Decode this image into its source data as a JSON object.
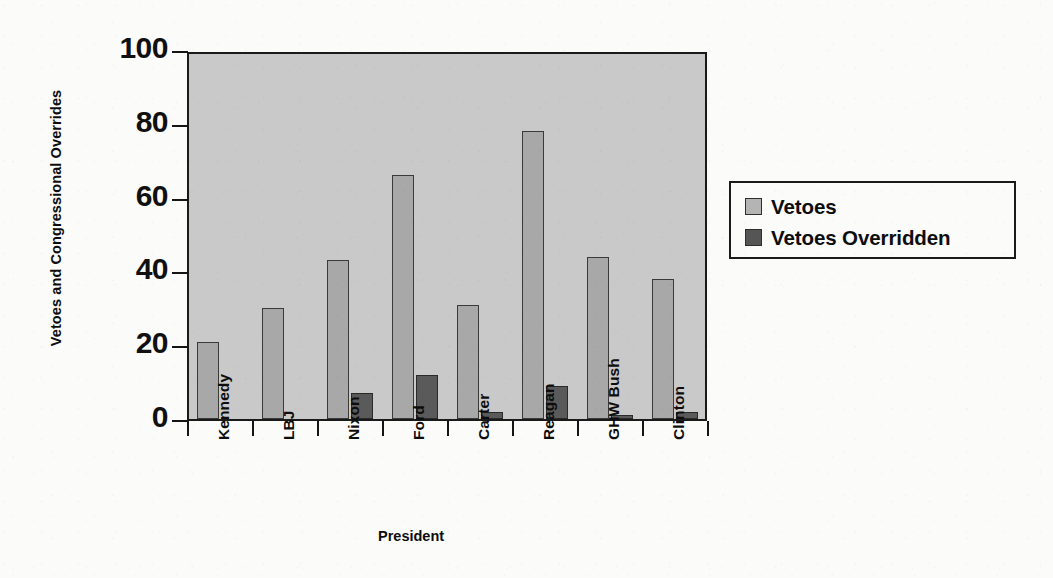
{
  "chart_data": {
    "type": "bar",
    "title": "",
    "xlabel": "President",
    "ylabel": "Vetoes and Congressional Overrides",
    "categories": [
      "Kennedy",
      "LBJ",
      "Nixon",
      "Ford",
      "Carter",
      "Reagan",
      "GHW Bush",
      "Clinton"
    ],
    "series": [
      {
        "name": "Vetoes",
        "values": [
          21,
          30,
          43,
          66,
          31,
          78,
          44,
          38
        ],
        "color": "#a8a8a8"
      },
      {
        "name": "Vetoes Overridden",
        "values": [
          0,
          0,
          7,
          12,
          2,
          9,
          1,
          2
        ],
        "color": "#5a5a5a"
      }
    ],
    "ylim": [
      0,
      100
    ],
    "yticks": [
      0,
      20,
      40,
      60,
      80,
      100
    ],
    "ytick_labels": [
      "0",
      "20",
      "40",
      "60",
      "80",
      "100"
    ],
    "grid": false,
    "legend_position": "right",
    "plot_background": "#c9c9c9"
  },
  "legend": {
    "items": [
      {
        "label": "Vetoes",
        "swatch": "light-gray-swatch-icon"
      },
      {
        "label": "Vetoes Overridden",
        "swatch": "dark-gray-swatch-icon"
      }
    ]
  }
}
